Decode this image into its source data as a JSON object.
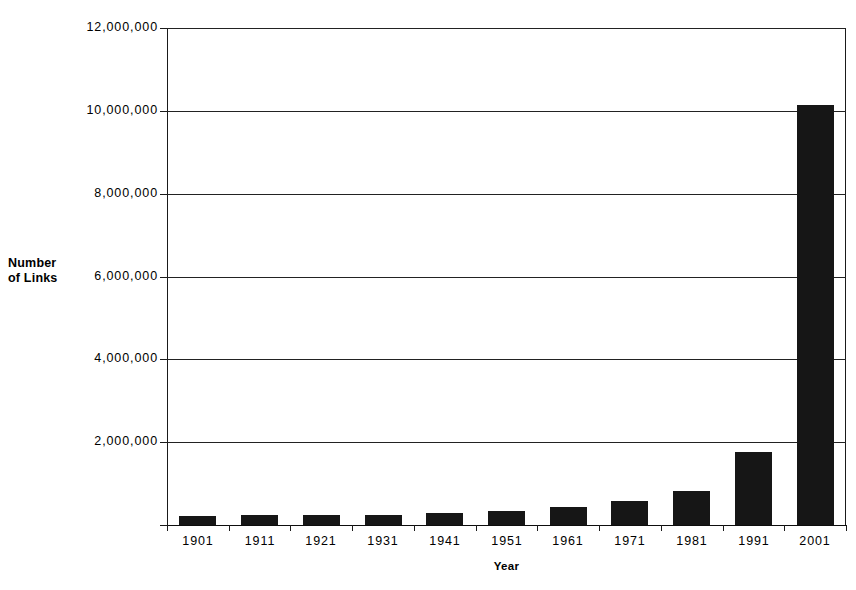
{
  "chart_data": {
    "type": "bar",
    "title": "",
    "xlabel": "Year",
    "ylabel": "Number of Links",
    "ylabel_lines": [
      "Number",
      "of Links"
    ],
    "categories": [
      "1901",
      "1911",
      "1921",
      "1931",
      "1941",
      "1951",
      "1961",
      "1971",
      "1981",
      "1991",
      "2001"
    ],
    "values": [
      220000,
      230000,
      235000,
      250000,
      285000,
      330000,
      430000,
      580000,
      820000,
      1770000,
      10150000
    ],
    "ylim": [
      0,
      12000000
    ],
    "ytick_values": [
      0,
      2000000,
      4000000,
      6000000,
      8000000,
      10000000,
      12000000
    ],
    "ytick_labels": [
      "",
      "2,000,000",
      "4,000,000",
      "6,000,000",
      "8,000,000",
      "10,000,000",
      "12,000,000"
    ],
    "grid": true,
    "legend": "none",
    "bar_color": "#161616",
    "axis_color": "#1a1a1a",
    "background": "#ffffff"
  }
}
